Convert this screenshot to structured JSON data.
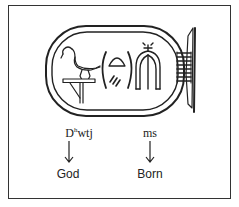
{
  "figure": {
    "type": "cartouche-transliteration",
    "cartouche": {
      "glyphs": [
        "ibis-on-standard",
        "placenta-in-brackets",
        "ms-triple-fox-skins"
      ]
    },
    "words": [
      {
        "transliteration_base": "D",
        "transliteration_sup": "h",
        "transliteration_rest": "wtj",
        "arrow": "↓",
        "meaning": "God"
      },
      {
        "transliteration_base": "ms",
        "transliteration_sup": "",
        "transliteration_rest": "",
        "arrow": "↓",
        "meaning": "Born"
      }
    ]
  },
  "colors": {
    "ink": "#222222",
    "frame": "#333333",
    "background": "#ffffff"
  }
}
